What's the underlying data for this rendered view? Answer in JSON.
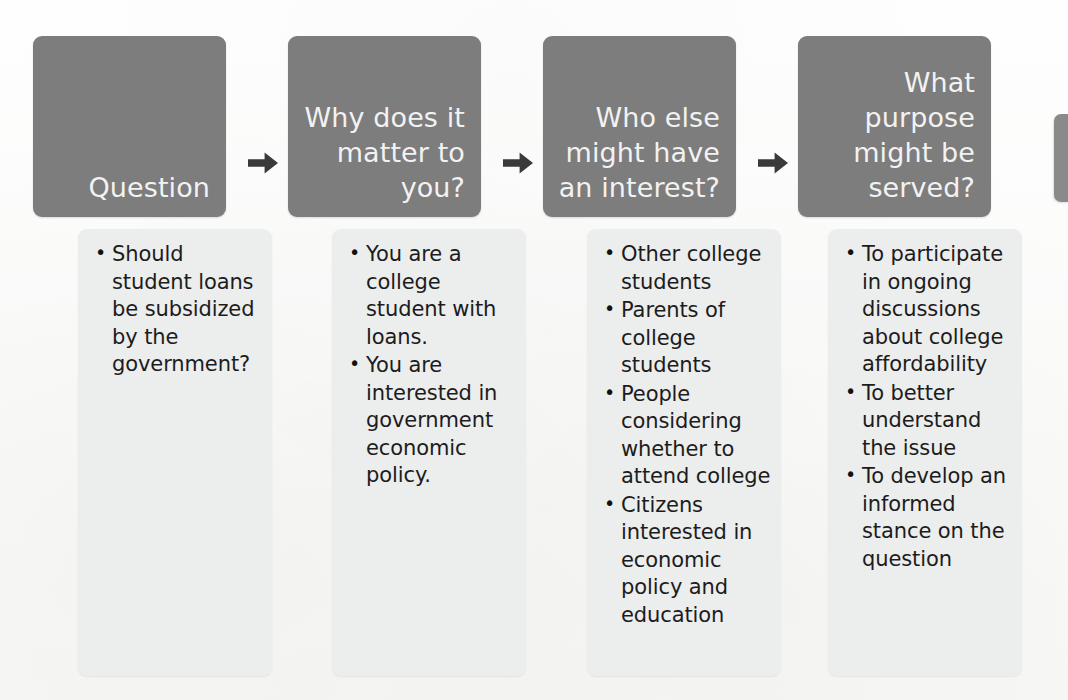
{
  "diagram": {
    "type": "process-flow",
    "title": "",
    "orientation": "left-to-right",
    "arrow_glyph": "right-arrow-icon",
    "colors": {
      "header_fill": "#7d7d7d",
      "header_text": "#f2f2f2",
      "body_fill": "#eceded",
      "body_text": "#1c1c1c",
      "arrow": "#3a3a3a",
      "page_background": "#fdfdfd"
    },
    "columns": [
      {
        "header": "Question",
        "items": [
          "Should student loans be subsidized by the government?"
        ]
      },
      {
        "header": "Why does it matter to you?",
        "items": [
          "You are a college student with loans.",
          "You are interested in government economic policy."
        ]
      },
      {
        "header": "Who else might have an interest?",
        "items": [
          "Other college students",
          "Parents of college students",
          "People considering whether to attend college",
          "Citizens interested in economic policy and education"
        ]
      },
      {
        "header": "What purpose might be served?",
        "items": [
          "To participate in ongoing discussions about college affordability",
          "To better understand the issue",
          "To develop an informed stance on the question"
        ]
      }
    ],
    "partial_box": {
      "label": "",
      "note": "cut off at right page edge"
    }
  }
}
